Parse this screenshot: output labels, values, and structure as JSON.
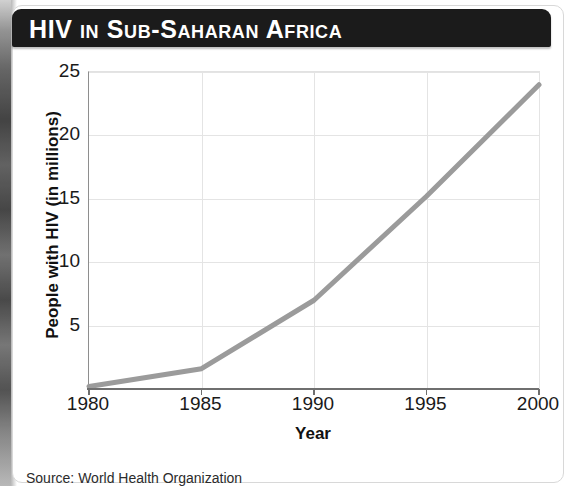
{
  "figure": {
    "title": "HIV in Sub-Saharan Africa",
    "source_note": "Source: World Health Organization"
  },
  "chart_data": {
    "type": "line",
    "title": "HIV in Sub-Saharan Africa",
    "xlabel": "Year",
    "ylabel": "People with HIV (in millions)",
    "x": [
      1980,
      1985,
      1990,
      1995,
      2000
    ],
    "values": [
      0.2,
      1.6,
      7.0,
      15.2,
      24.0
    ],
    "series": [
      {
        "name": "People with HIV (in millions)",
        "values": [
          0.2,
          1.6,
          7.0,
          15.2,
          24.0
        ],
        "color": "#9b9b9b"
      }
    ],
    "xlim": [
      1980,
      2000
    ],
    "ylim": [
      0,
      25
    ],
    "xticks": [
      1980,
      1985,
      1990,
      1995,
      2000
    ],
    "xtick_labels": [
      "1980",
      "1985",
      "1990",
      "1995",
      "2000"
    ],
    "yticks": [
      5,
      10,
      15,
      20,
      25
    ],
    "ytick_labels": [
      "5",
      "10",
      "15",
      "20",
      "25"
    ],
    "grid": true,
    "legend": false,
    "line_color": "#9b9b9b",
    "line_width_px": 5
  }
}
